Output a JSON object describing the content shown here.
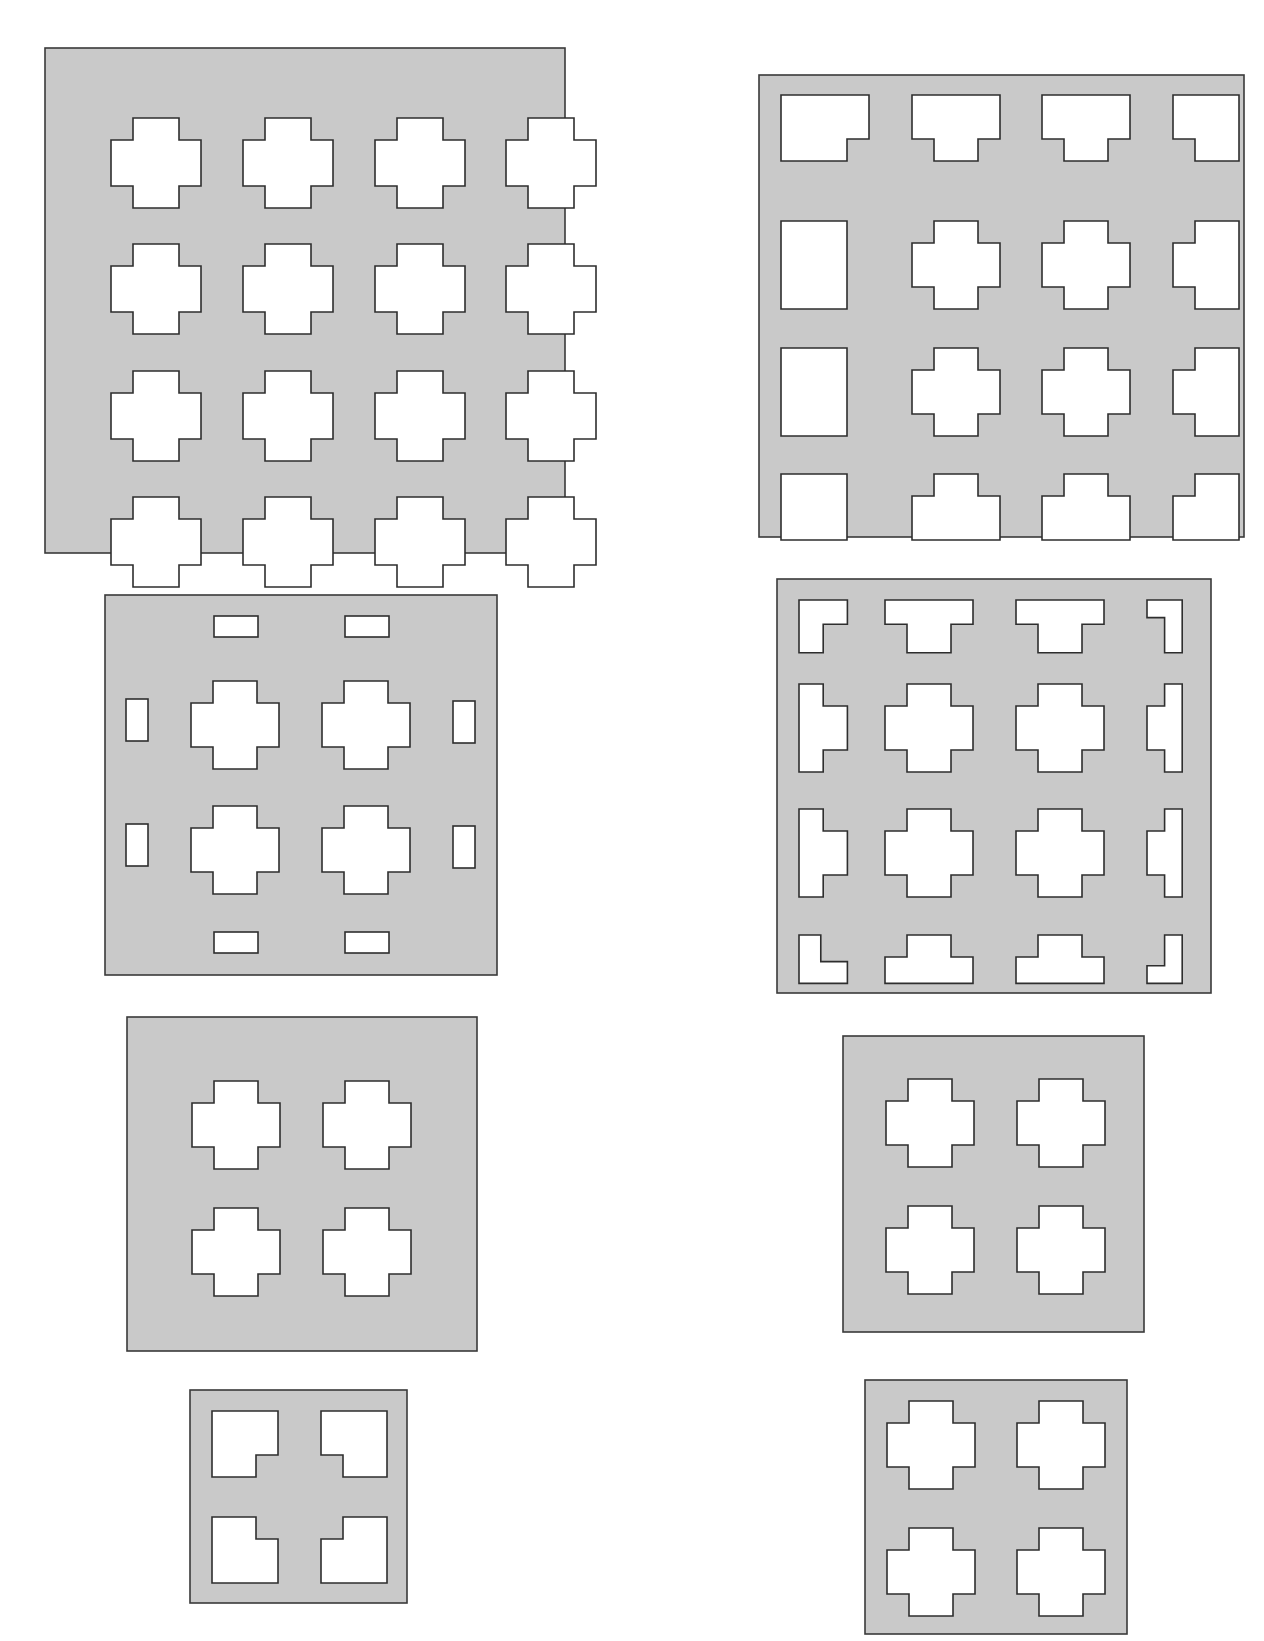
{
  "figure": {
    "colors": {
      "plate": "#c9c9c9",
      "outline": "#2e2e2e",
      "hole": "#ffffff",
      "background": "#ffffff"
    }
  },
  "panels": [
    {
      "id": "panel-a",
      "label": "4x4 full cross grid",
      "x": 45,
      "y": 48,
      "w": 520,
      "h": 505,
      "cols": [
        66,
        198,
        330,
        461
      ],
      "rows": [
        70,
        196,
        323,
        449
      ],
      "arm": 90,
      "notch": 22,
      "tiles": [
        [
          "cross",
          "cross",
          "cross",
          "cross"
        ],
        [
          "cross",
          "cross",
          "cross",
          "cross"
        ],
        [
          "cross",
          "cross",
          "cross",
          "cross"
        ],
        [
          "cross",
          "cross",
          "cross",
          "cross"
        ]
      ]
    },
    {
      "id": "panel-b",
      "label": "4x4 grid with clipped edge crosses",
      "x": 759,
      "y": 75,
      "w": 485,
      "h": 462,
      "cols": [
        22,
        153,
        283,
        414
      ],
      "rows": [
        20,
        146,
        273,
        399
      ],
      "arm": 88,
      "notch": 22,
      "tiles": [
        [
          "corner-tl",
          "edge-t",
          "edge-t",
          "corner-tr"
        ],
        [
          "edge-l",
          "cross",
          "cross",
          "edge-r"
        ],
        [
          "edge-l",
          "cross",
          "cross",
          "edge-r"
        ],
        [
          "corner-bl",
          "edge-b",
          "edge-b",
          "corner-br"
        ]
      ]
    },
    {
      "id": "panel-c",
      "label": "2x2 cross grid with edge slots",
      "x": 105,
      "y": 595,
      "w": 392,
      "h": 380,
      "cols": [
        86,
        217
      ],
      "rows": [
        86,
        211
      ],
      "arm": 88,
      "notch": 22,
      "tiles": [
        [
          "cross",
          "cross"
        ],
        [
          "cross",
          "cross"
        ]
      ],
      "slots": [
        {
          "x": 109,
          "y": 21,
          "w": 44,
          "h": 21
        },
        {
          "x": 240,
          "y": 21,
          "w": 44,
          "h": 21
        },
        {
          "x": 109,
          "y": 337,
          "w": 44,
          "h": 21
        },
        {
          "x": 240,
          "y": 337,
          "w": 44,
          "h": 21
        },
        {
          "x": 21,
          "y": 104,
          "w": 22,
          "h": 42
        },
        {
          "x": 348,
          "y": 106,
          "w": 22,
          "h": 42
        },
        {
          "x": 21,
          "y": 229,
          "w": 22,
          "h": 42
        },
        {
          "x": 348,
          "y": 231,
          "w": 22,
          "h": 42
        }
      ]
    },
    {
      "id": "panel-d",
      "label": "4x4 grid with thin clipped edge pieces",
      "x": 777,
      "y": 579,
      "w": 434,
      "h": 414,
      "cols": [
        22,
        108,
        239,
        370
      ],
      "rows": [
        21,
        105,
        230,
        356
      ],
      "arm": 88,
      "notch": 22,
      "tiles": [
        [
          "corner-tl-thin",
          "edge-t-thin",
          "edge-t-thin",
          "corner-tr-thin"
        ],
        [
          "edge-l-thin",
          "cross",
          "cross",
          "edge-r-thin"
        ],
        [
          "edge-l-thin",
          "cross",
          "cross",
          "edge-r-thin"
        ],
        [
          "corner-bl-thin",
          "edge-b-thin",
          "edge-b-thin",
          "corner-br-thin"
        ]
      ]
    },
    {
      "id": "panel-e",
      "label": "2x2 cross grid",
      "x": 127,
      "y": 1017,
      "w": 350,
      "h": 334,
      "cols": [
        65,
        196
      ],
      "rows": [
        64,
        191
      ],
      "arm": 88,
      "notch": 22,
      "tiles": [
        [
          "cross",
          "cross"
        ],
        [
          "cross",
          "cross"
        ]
      ]
    },
    {
      "id": "panel-f",
      "label": "2x2 cross grid",
      "x": 843,
      "y": 1036,
      "w": 301,
      "h": 296,
      "cols": [
        43,
        174
      ],
      "rows": [
        43,
        170
      ],
      "arm": 88,
      "notch": 22,
      "tiles": [
        [
          "cross",
          "cross"
        ],
        [
          "cross",
          "cross"
        ]
      ]
    },
    {
      "id": "panel-g",
      "label": "2x2 quarter-cross grid",
      "x": 190,
      "y": 1390,
      "w": 217,
      "h": 213,
      "cols": [
        22,
        131
      ],
      "rows": [
        21,
        127
      ],
      "arm": 66,
      "notch": 22,
      "tiles": [
        [
          "corner-br-q",
          "corner-bl-q"
        ],
        [
          "corner-tr-q",
          "corner-tl-q"
        ]
      ]
    },
    {
      "id": "panel-h",
      "label": "2x2 cross grid",
      "x": 865,
      "y": 1380,
      "w": 262,
      "h": 254,
      "cols": [
        22,
        152
      ],
      "rows": [
        21,
        148
      ],
      "arm": 88,
      "notch": 22,
      "tiles": [
        [
          "cross",
          "cross"
        ],
        [
          "cross",
          "cross"
        ]
      ]
    }
  ]
}
